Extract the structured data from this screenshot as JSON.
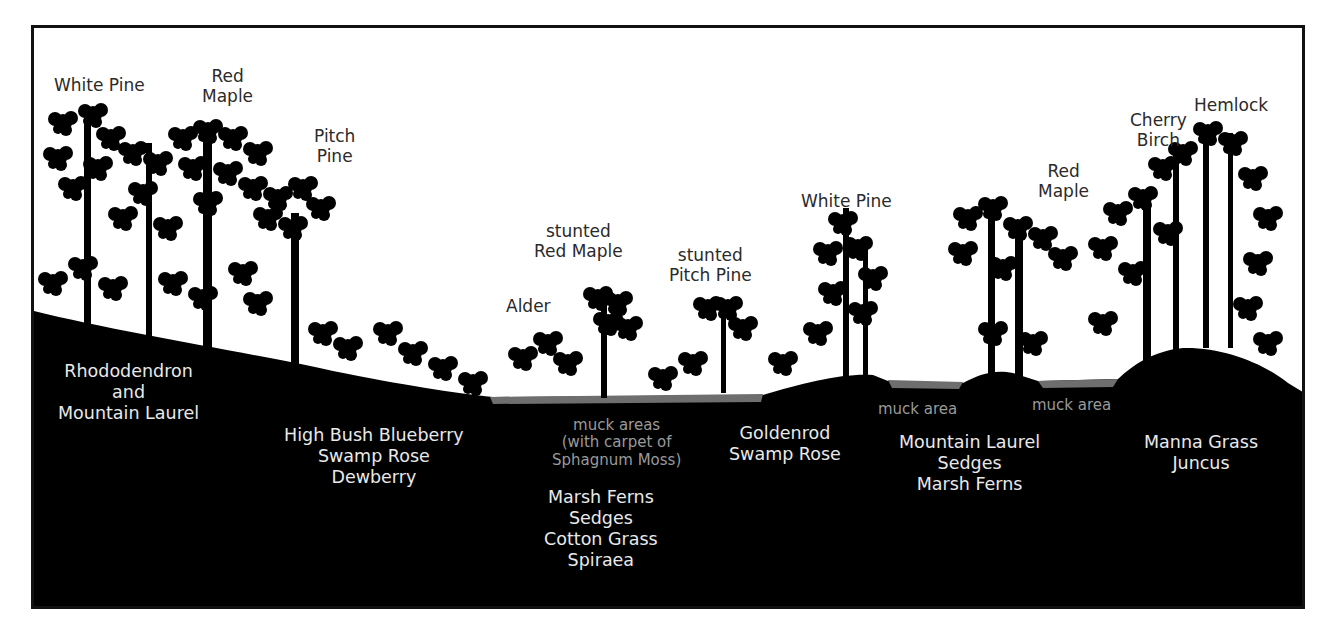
{
  "diagram": {
    "title": "",
    "type": "ecological cross-section / vegetation profile",
    "colors": {
      "ground": "#000000",
      "sky": "#ffffff",
      "muck": "#6e6e6e",
      "tree_label": "#2a2a2a",
      "ground_label": "#e9e9e9",
      "muck_label": "#9a9a9a"
    },
    "tree_labels": [
      {
        "id": "white-pine-left",
        "lines": [
          "White Pine"
        ]
      },
      {
        "id": "red-maple-left",
        "lines": [
          "Red",
          "Maple"
        ]
      },
      {
        "id": "pitch-pine",
        "lines": [
          "Pitch",
          "Pine"
        ]
      },
      {
        "id": "alder",
        "lines": [
          "Alder"
        ]
      },
      {
        "id": "stunted-red-maple",
        "lines": [
          "stunted",
          "Red Maple"
        ]
      },
      {
        "id": "stunted-pitch-pine",
        "lines": [
          "stunted",
          "Pitch Pine"
        ]
      },
      {
        "id": "white-pine-center",
        "lines": [
          "White Pine"
        ]
      },
      {
        "id": "red-maple-right",
        "lines": [
          "Red",
          "Maple"
        ]
      },
      {
        "id": "cherry-birch",
        "lines": [
          "Cherry",
          "Birch"
        ]
      },
      {
        "id": "hemlock",
        "lines": [
          "Hemlock"
        ]
      }
    ],
    "ground_labels": [
      {
        "id": "rhododendron-zone",
        "lines": [
          "Rhododendron",
          "and",
          "Mountain Laurel"
        ]
      },
      {
        "id": "blueberry-zone",
        "lines": [
          "High Bush Blueberry",
          "Swamp Rose",
          "Dewberry"
        ]
      },
      {
        "id": "bog-center-zone",
        "lines": [
          "Marsh Ferns",
          "Sedges",
          "Cotton Grass",
          "Spiraea"
        ]
      },
      {
        "id": "goldenrod-zone",
        "lines": [
          "Goldenrod",
          "Swamp Rose"
        ]
      },
      {
        "id": "laurel-sedge-zone",
        "lines": [
          "Mountain Laurel",
          "Sedges",
          "Marsh Ferns"
        ]
      },
      {
        "id": "manna-grass-zone",
        "lines": [
          "Manna Grass",
          "Juncus"
        ]
      }
    ],
    "muck_labels": [
      {
        "id": "muck-areas-center",
        "lines": [
          "muck areas",
          "(with carpet of",
          "Sphagnum Moss)"
        ]
      },
      {
        "id": "muck-area-1",
        "lines": [
          "muck area"
        ]
      },
      {
        "id": "muck-area-2",
        "lines": [
          "muck area"
        ]
      }
    ]
  }
}
